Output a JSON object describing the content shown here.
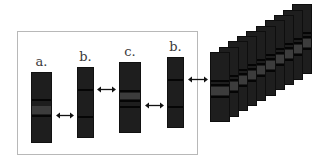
{
  "diagram": {
    "frame_color": "#b8b8b8",
    "strip_color": "#1e1e1e",
    "band_dark_color": "#050505",
    "band_gray_color": "#3c3c3c",
    "strips": [
      {
        "label": "a.",
        "x": 31,
        "y": 72,
        "w": 21,
        "h": 71,
        "label_y": 55,
        "bands": [
          {
            "y": 26,
            "h": 2,
            "type": "dark"
          },
          {
            "y": 33,
            "h": 8,
            "type": "gray"
          },
          {
            "y": 42,
            "h": 2,
            "type": "dark"
          }
        ]
      },
      {
        "label": "b.",
        "x": 77,
        "y": 67,
        "w": 17,
        "h": 71,
        "label_y": 50,
        "bands": [
          {
            "y": 21,
            "h": 2,
            "type": "dark"
          },
          {
            "y": 48,
            "h": 2,
            "type": "dark"
          }
        ]
      },
      {
        "label": "c.",
        "x": 119,
        "y": 62,
        "w": 22,
        "h": 71,
        "label_y": 45,
        "bands": [
          {
            "y": 27,
            "h": 2,
            "type": "dark"
          },
          {
            "y": 30,
            "h": 6,
            "type": "gray"
          },
          {
            "y": 37,
            "h": 2,
            "type": "dark"
          },
          {
            "y": 43,
            "h": 2,
            "type": "dark"
          }
        ]
      },
      {
        "label": "b.",
        "x": 167,
        "y": 57,
        "w": 17,
        "h": 71,
        "label_y": 40,
        "bands": [
          {
            "y": 21,
            "h": 2,
            "type": "dark"
          },
          {
            "y": 48,
            "h": 2,
            "type": "dark"
          }
        ]
      }
    ],
    "arrows": [
      {
        "name": "arrow-a-b",
        "x1": 56,
        "x2": 74,
        "y": 115
      },
      {
        "name": "arrow-b-c",
        "x1": 97,
        "x2": 116,
        "y": 89
      },
      {
        "name": "arrow-c-b",
        "x1": 145,
        "x2": 164,
        "y": 105
      },
      {
        "name": "arrow-b-stack",
        "x1": 188,
        "x2": 208,
        "y": 79
      }
    ],
    "stack": {
      "count": 10,
      "front_x": 210,
      "front_y": 52,
      "w": 20,
      "h": 70,
      "dx": 9.1,
      "dy": -5.3,
      "bands": [
        {
          "y": 27,
          "h": 2,
          "type": "dark"
        },
        {
          "y": 31,
          "h": 2,
          "type": "dark"
        },
        {
          "y": 34,
          "h": 8,
          "type": "gray"
        },
        {
          "y": 43,
          "h": 2,
          "type": "dark"
        }
      ]
    }
  }
}
